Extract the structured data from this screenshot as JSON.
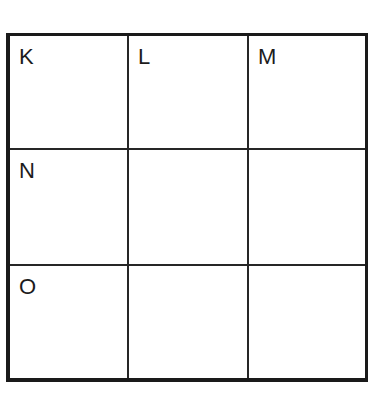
{
  "grid": {
    "rows": 3,
    "cols": 3,
    "cells": [
      [
        "K",
        "L",
        "M"
      ],
      [
        "N",
        "",
        ""
      ],
      [
        "O",
        "",
        ""
      ]
    ]
  }
}
